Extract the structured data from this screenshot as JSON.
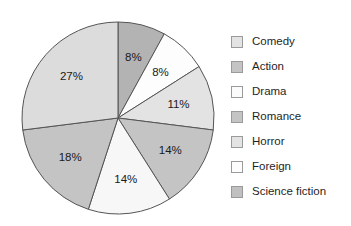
{
  "chart_data": {
    "type": "pie",
    "title": "",
    "subtitle": "",
    "xlabel": "",
    "ylabel": "",
    "legend_position": "right",
    "grid": false,
    "start_angle_deg": 0,
    "direction": "clockwise",
    "categories": [
      "Comedy",
      "Action",
      "Drama",
      "Romance",
      "Horror",
      "Foreign",
      "Science fiction"
    ],
    "values": [
      8,
      8,
      11,
      14,
      14,
      18,
      27
    ],
    "value_unit": "%",
    "data_labels": [
      "8%",
      "8%",
      "11%",
      "14%",
      "14%",
      "18%",
      "27%"
    ],
    "slice_colors": [
      "#b3b3b3",
      "#fdfdfd",
      "#e3e3e3",
      "#c4c4c4",
      "#f7f7f7",
      "#c4c4c4",
      "#dcdcdc"
    ],
    "slice_outline_color": "#555555",
    "slices": [
      {
        "label": "Comedy",
        "value": 8,
        "data_label": "8%",
        "color": "#b3b3b3"
      },
      {
        "label": "Action",
        "value": 8,
        "data_label": "8%",
        "color": "#fdfdfd"
      },
      {
        "label": "Drama",
        "value": 11,
        "data_label": "11%",
        "color": "#e3e3e3"
      },
      {
        "label": "Romance",
        "value": 14,
        "data_label": "14%",
        "color": "#c4c4c4"
      },
      {
        "label": "Horror",
        "value": 14,
        "data_label": "14%",
        "color": "#f7f7f7"
      },
      {
        "label": "Foreign",
        "value": 18,
        "data_label": "18%",
        "color": "#c4c4c4"
      },
      {
        "label": "Science fiction",
        "value": 27,
        "data_label": "27%",
        "color": "#dcdcdc"
      }
    ]
  },
  "legend": {
    "items": [
      {
        "label": "Comedy",
        "color": "#e3e3e3"
      },
      {
        "label": "Action",
        "color": "#c4c4c4"
      },
      {
        "label": "Drama",
        "color": "#fbfbfb"
      },
      {
        "label": "Romance",
        "color": "#c4c4c4"
      },
      {
        "label": "Horror",
        "color": "#e3e3e3"
      },
      {
        "label": "Foreign",
        "color": "#fdfdfd"
      },
      {
        "label": "Science fiction",
        "color": "#c0c0c0"
      }
    ]
  }
}
